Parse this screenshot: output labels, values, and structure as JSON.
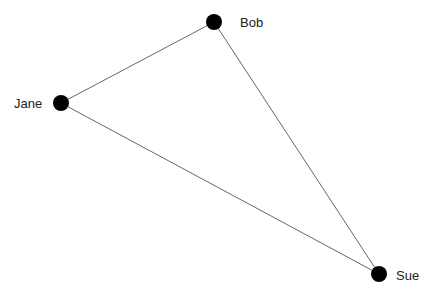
{
  "diagram": {
    "type": "network-graph",
    "nodes": [
      {
        "id": "bob",
        "label": "Bob",
        "x": 214,
        "y": 22,
        "r": 8,
        "label_x": 240,
        "label_y": 27
      },
      {
        "id": "jane",
        "label": "Jane",
        "x": 61,
        "y": 103,
        "r": 8,
        "label_x": 14,
        "label_y": 108
      },
      {
        "id": "sue",
        "label": "Sue",
        "x": 379,
        "y": 274,
        "r": 8,
        "label_x": 396,
        "label_y": 280
      }
    ],
    "edges": [
      {
        "from": "jane",
        "to": "bob"
      },
      {
        "from": "bob",
        "to": "sue"
      },
      {
        "from": "jane",
        "to": "sue"
      }
    ],
    "colors": {
      "node": "#000000",
      "edge": "#555555",
      "label": "#222222",
      "background": "#ffffff"
    }
  }
}
